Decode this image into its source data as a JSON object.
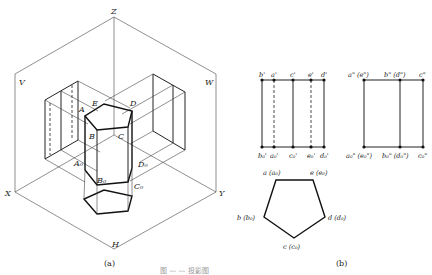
{
  "figure_a": {
    "caption": "(a)",
    "axis_labels": {
      "z": "Z",
      "x": "X",
      "y": "Y",
      "h": "H",
      "v": "V",
      "w": "W"
    },
    "vertex_labels": {
      "A": "A",
      "B": "B",
      "C": "C",
      "D": "D",
      "E": "E",
      "A0": "A₀",
      "B0": "B₀",
      "C0": "C₀",
      "D0": "D₀"
    }
  },
  "figure_b": {
    "caption": "(b)",
    "front_view": {
      "top_labels": [
        "b'",
        "a'",
        "c'",
        "e'",
        "d'"
      ],
      "bottom_labels": [
        "b₀'",
        "a₀'",
        "c₀'",
        "e₀'",
        "d₀'"
      ]
    },
    "side_view": {
      "top_labels": [
        "a\" (e\")",
        "b\" (d\")",
        "c\""
      ],
      "bottom_labels": [
        "a₀\" (e₀\")",
        "b₀\" (d₀\")",
        "c₀\""
      ]
    },
    "top_view": {
      "labels": {
        "a": "a (a₀)",
        "e": "e (e₀)",
        "b": "b (b₀)",
        "d": "d (d₀)",
        "c": "c (c₀)"
      }
    }
  },
  "footer_caption": "图 — — 投影图"
}
